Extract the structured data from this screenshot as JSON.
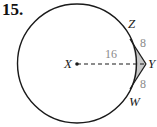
{
  "problem": {
    "number": "15."
  },
  "diagram": {
    "points": {
      "center": "X",
      "top_tangent": "Z",
      "external": "Y",
      "bottom_tangent": "W"
    },
    "measurements": {
      "XY_segment_label": "16",
      "ZY_label": "8",
      "WY_label": "8"
    },
    "colors": {
      "stroke": "#1a1a1a",
      "shaded_region": "#c8c8c8",
      "measure_text": "#8a8a8a"
    }
  }
}
